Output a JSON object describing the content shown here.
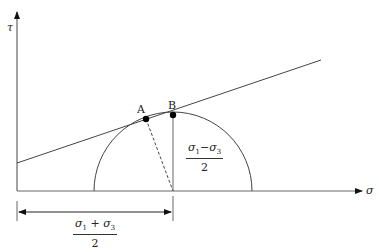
{
  "diagram": {
    "axes": {
      "y_label": "τ",
      "x_label": "σ"
    },
    "points": [
      {
        "label": "A"
      },
      {
        "label": "B"
      }
    ],
    "radius_label": {
      "numerator_a": "σ",
      "numerator_a_sub": "1",
      "op": "−",
      "numerator_b": "σ",
      "numerator_b_sub": "3",
      "denominator": "2"
    },
    "center_label": {
      "numerator_a": "σ",
      "numerator_a_sub": "1",
      "op": "+",
      "numerator_b": "σ",
      "numerator_b_sub": "3",
      "denominator": "2"
    },
    "colors": {
      "stroke": "#333333",
      "background": "#ffffff"
    }
  }
}
